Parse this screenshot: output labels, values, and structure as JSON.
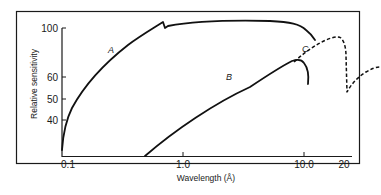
{
  "chart_data": {
    "type": "line",
    "title": "",
    "xlabel": "Wavelength (Å)",
    "ylabel": "Relative sensitivity",
    "x_scale": "log",
    "y_scale": "log",
    "xlim": [
      0.1,
      25
    ],
    "ylim": [
      30,
      100
    ],
    "x_ticks": [
      "0.1",
      "1.0",
      "10.0",
      "20"
    ],
    "y_ticks": [
      "100",
      "60",
      "50",
      "40"
    ],
    "grid": false,
    "legend": "none (curves labeled inline A, B, C)",
    "series": [
      {
        "name": "A",
        "style": "solid",
        "x": [
          0.1,
          0.12,
          0.15,
          0.2,
          0.3,
          0.45,
          0.6,
          0.8,
          0.75,
          0.8,
          1.0,
          2.0,
          4.0,
          5.0,
          6.0
        ],
        "y": [
          32,
          42,
          52,
          62,
          78,
          92,
          100,
          106,
          97,
          100,
          102,
          103,
          102,
          97,
          93
        ]
      },
      {
        "name": "B",
        "style": "solid",
        "x": [
          0.5,
          0.8,
          1.0,
          1.5,
          2.0,
          3.0,
          4.0,
          5.0,
          5.5,
          6.0,
          6.5
        ],
        "y": [
          30,
          34,
          37,
          43,
          48,
          57,
          63,
          67,
          66,
          62,
          56
        ]
      },
      {
        "name": "C",
        "style": "dashed",
        "x": [
          4.5,
          6.0,
          7.0,
          8.0,
          9.0,
          9.5,
          9.5,
          9.7,
          11.0,
          14.0,
          18.0,
          22.0
        ],
        "y": [
          64,
          72,
          77,
          80,
          79,
          76,
          56,
          54,
          58,
          63,
          66,
          67
        ]
      }
    ],
    "annotations": [
      {
        "text": "A",
        "x": 0.35,
        "y": 85
      },
      {
        "text": "B",
        "x": 3.0,
        "y": 59
      },
      {
        "text": "C",
        "x": 10.0,
        "y": 75
      }
    ]
  },
  "axes": {
    "xlabel": "Wavelength (Å)",
    "ylabel": "Relative sensitivity",
    "x_ticks": [
      {
        "label": "0.1",
        "px": 62
      },
      {
        "label": "1.0",
        "px": 183
      },
      {
        "label": "10.0",
        "px": 304
      },
      {
        "label": "20",
        "px": 340
      }
    ],
    "y_ticks": [
      {
        "label": "100",
        "py": 28
      },
      {
        "label": "60",
        "py": 77
      },
      {
        "label": "50",
        "py": 99
      },
      {
        "label": "40",
        "py": 120
      }
    ]
  },
  "curves": {
    "A": {
      "label": "A",
      "path": "M62,150 C63,135 66,120 72,108 C85,84 105,63 128,45 C140,36 152,29 163,22 L165,28 L168,26 C190,22 230,20 270,21 C290,22 300,24 306,30 C310,33 313,37 315,40"
    },
    "B": {
      "label": "B",
      "path": "M145,156 C175,130 215,103 250,87 C268,75 282,66 292,61 C298,59 302,60 304,63 C308,68 309,75 308,84"
    },
    "C": {
      "label": "C",
      "path": "M294,62 C305,52 315,45 326,40 C333,37 338,36 341,38 C345,42 346,50 346,56 L347,92 C352,83 358,77 366,72 C371,69 376,67 380,67"
    }
  },
  "labels": {
    "A": {
      "text": "A",
      "x": 108,
      "y": 53
    },
    "B": {
      "text": "B",
      "x": 226,
      "y": 80
    },
    "C": {
      "text": "C",
      "x": 302,
      "y": 52
    }
  }
}
